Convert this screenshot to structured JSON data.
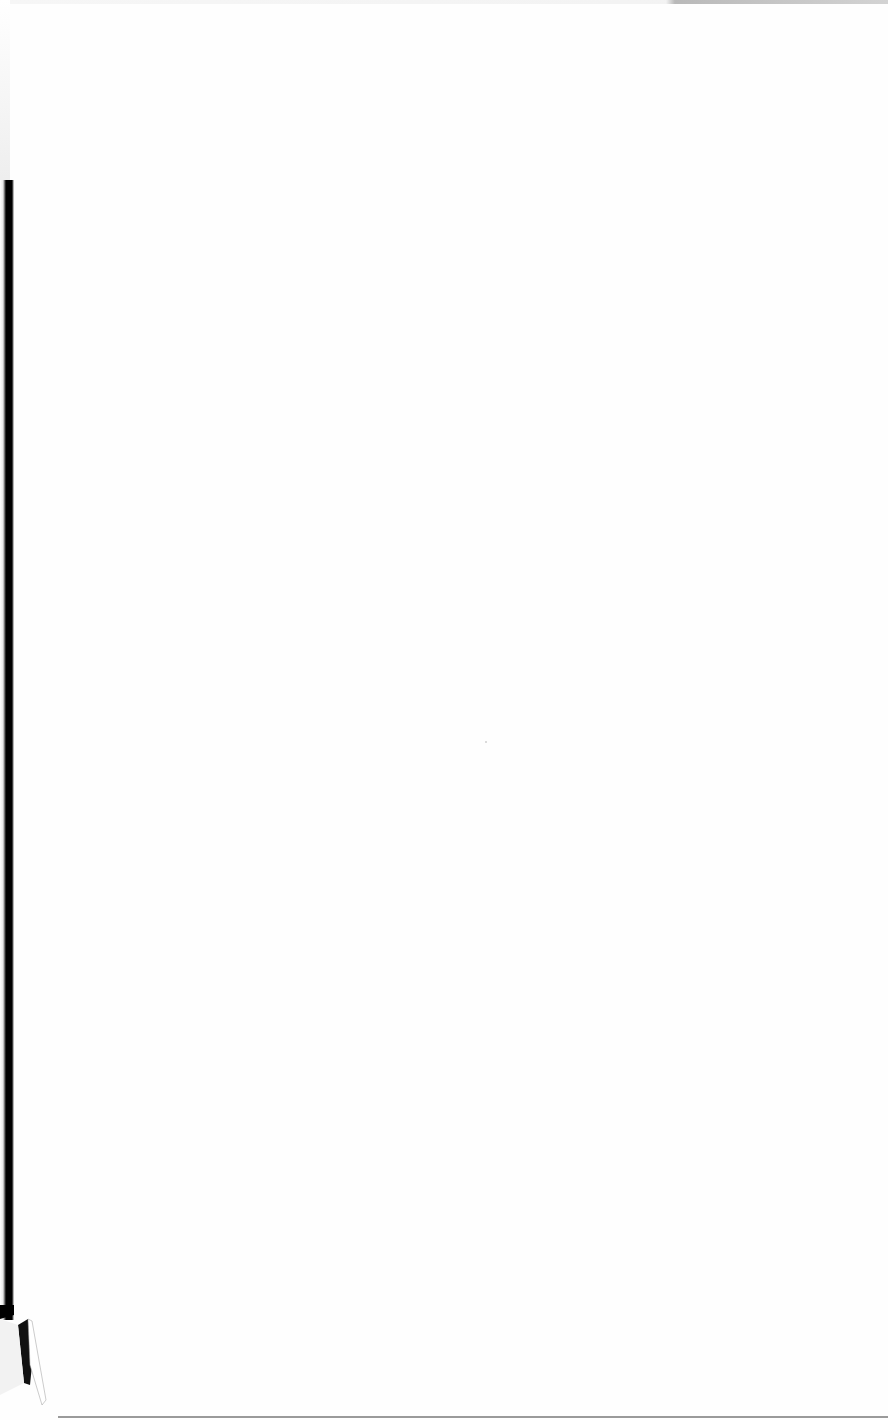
{
  "document": {
    "type": "scanned-page",
    "content": "",
    "is_blank": true
  },
  "colors": {
    "paper": "#fefefe",
    "binding_shadow": "#000000",
    "edge_rule": "#9a9a9a"
  }
}
